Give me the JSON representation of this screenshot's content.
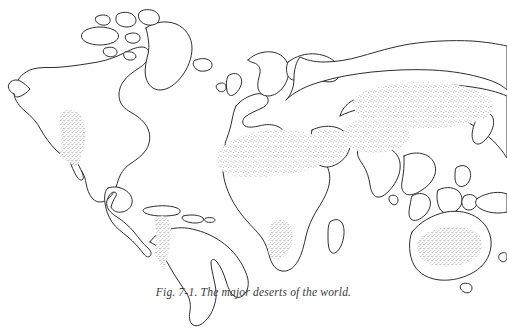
{
  "figure": {
    "caption": "Fig. 7-1. The major deserts of the world.",
    "caption_number": "Fig. 7-1.",
    "caption_text": "The major deserts of the world.",
    "page_background": "#fefefe",
    "coastline_color": "#2e2e2e",
    "stipple_color": "#4a4a4a",
    "land_fill": "#ffffff"
  },
  "map": {
    "projection_note": "world map, equirectangular-like outline, no labels, no graticule",
    "title": "",
    "legend": [],
    "labels": [],
    "landmasses": [
      {
        "name": "north-america",
        "label": ""
      },
      {
        "name": "greenland",
        "label": ""
      },
      {
        "name": "arctic-islands",
        "label": ""
      },
      {
        "name": "central-america",
        "label": ""
      },
      {
        "name": "caribbean-islands",
        "label": ""
      },
      {
        "name": "south-america",
        "label": ""
      },
      {
        "name": "europe",
        "label": ""
      },
      {
        "name": "british-isles",
        "label": ""
      },
      {
        "name": "scandinavia",
        "label": ""
      },
      {
        "name": "africa",
        "label": ""
      },
      {
        "name": "madagascar",
        "label": ""
      },
      {
        "name": "arabia",
        "label": ""
      },
      {
        "name": "asia",
        "label": ""
      },
      {
        "name": "india",
        "label": ""
      },
      {
        "name": "sri-lanka",
        "label": ""
      },
      {
        "name": "japan",
        "label": ""
      },
      {
        "name": "southeast-asia-islands",
        "label": ""
      },
      {
        "name": "new-guinea",
        "label": ""
      },
      {
        "name": "australia",
        "label": ""
      },
      {
        "name": "tasmania",
        "label": ""
      },
      {
        "name": "new-zealand",
        "label": ""
      }
    ],
    "desert_regions": [
      {
        "name": "great-basin-sonoran-desert",
        "label": "",
        "continent": "north-america"
      },
      {
        "name": "atacama-patagonia-desert",
        "label": "",
        "continent": "south-america"
      },
      {
        "name": "sahara-desert",
        "label": "",
        "continent": "africa"
      },
      {
        "name": "arabian-desert",
        "label": "",
        "continent": "asia"
      },
      {
        "name": "kalahari-namib-desert",
        "label": "",
        "continent": "africa"
      },
      {
        "name": "iranian-thar-desert",
        "label": "",
        "continent": "asia"
      },
      {
        "name": "turkestan-gobi-taklamakan-desert",
        "label": "",
        "continent": "asia"
      },
      {
        "name": "australian-desert",
        "label": "",
        "continent": "australia"
      }
    ]
  }
}
